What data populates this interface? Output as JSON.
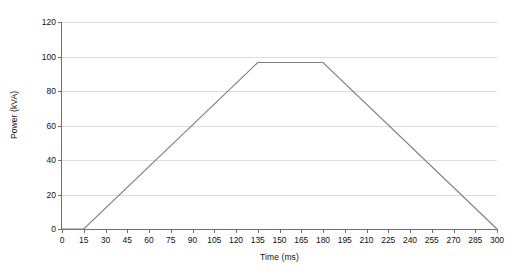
{
  "chart_data": {
    "type": "line",
    "title": "",
    "subtitle": "",
    "xlabel": "Time (ms)",
    "ylabel": "Power (kVA)",
    "xlim": [
      0,
      300
    ],
    "ylim": [
      0,
      120
    ],
    "xticks": [
      0,
      15,
      30,
      45,
      60,
      75,
      90,
      105,
      120,
      135,
      150,
      165,
      180,
      195,
      210,
      225,
      240,
      255,
      270,
      285,
      300
    ],
    "yticks": [
      0,
      20,
      40,
      60,
      80,
      100,
      120
    ],
    "grid": "horizontal",
    "legend": null,
    "annotations": [],
    "series": [
      {
        "name": "Power",
        "color": "#808080",
        "x": [
          0,
          15,
          135,
          180,
          300
        ],
        "values": [
          0,
          0,
          96.5,
          96.5,
          0
        ]
      }
    ]
  },
  "style": {
    "line_color": "#808080",
    "grid_color": "#dcdcdc",
    "axis_color": "#6e6e6e",
    "text_color": "#111111",
    "background": "#ffffff"
  }
}
